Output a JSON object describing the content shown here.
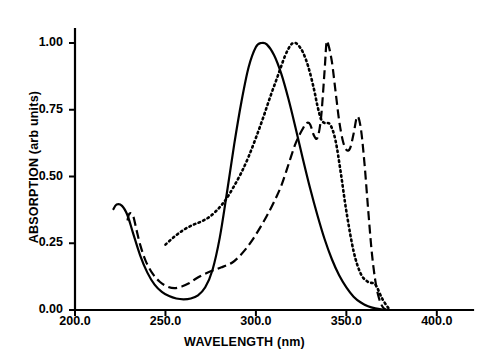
{
  "chart_data": {
    "type": "line",
    "title": "",
    "xlabel": "WAVELENGTH (nm)",
    "ylabel": "ABSORPTION (arb units)",
    "xlim": [
      200.0,
      420.0
    ],
    "ylim": [
      0.0,
      1.05
    ],
    "xticks": [
      "200.0",
      "250.0",
      "300.0",
      "350.0",
      "400.0"
    ],
    "xtick_values": [
      200.0,
      250.0,
      300.0,
      350.0,
      400.0
    ],
    "yticks": [
      "0.00",
      "0.25",
      "0.50",
      "0.75",
      "1.00"
    ],
    "ytick_values": [
      0.0,
      0.25,
      0.5,
      0.75,
      1.0
    ],
    "grid": false,
    "legend": "none",
    "axis_color": "#000000",
    "series": [
      {
        "name": "solid",
        "style": "solid",
        "color": "#000000",
        "peak_x": 303.0,
        "peak_y": 1.0,
        "x": [
          221,
          223,
          226,
          229,
          232,
          236,
          240,
          244,
          248,
          252,
          256,
          260,
          264,
          268,
          272,
          276,
          280,
          284,
          288,
          292,
          296,
          300,
          303,
          306,
          310,
          314,
          318,
          322,
          326,
          330,
          334,
          338,
          342,
          346,
          350,
          354,
          358,
          362,
          366,
          370,
          374
        ],
        "y": [
          0.375,
          0.395,
          0.39,
          0.355,
          0.29,
          0.205,
          0.14,
          0.095,
          0.068,
          0.052,
          0.043,
          0.04,
          0.043,
          0.055,
          0.085,
          0.15,
          0.27,
          0.44,
          0.62,
          0.78,
          0.91,
          0.985,
          1.0,
          0.995,
          0.955,
          0.885,
          0.79,
          0.68,
          0.565,
          0.455,
          0.355,
          0.265,
          0.19,
          0.13,
          0.085,
          0.05,
          0.028,
          0.014,
          0.006,
          0.002,
          0.0
        ]
      },
      {
        "name": "dotted",
        "style": "dotted",
        "color": "#000000",
        "peak_x": 321.0,
        "peak_y": 1.0,
        "x": [
          250,
          255,
          260,
          265,
          270,
          275,
          280,
          284,
          288,
          292,
          296,
          300,
          304,
          308,
          312,
          316,
          319,
          321,
          323,
          326,
          329,
          332,
          334,
          336,
          338,
          341,
          344,
          347,
          350,
          354,
          358,
          362,
          366,
          370,
          374
        ],
        "y": [
          0.245,
          0.275,
          0.3,
          0.318,
          0.332,
          0.352,
          0.385,
          0.42,
          0.465,
          0.515,
          0.575,
          0.645,
          0.72,
          0.8,
          0.875,
          0.95,
          0.99,
          1.0,
          0.995,
          0.965,
          0.91,
          0.83,
          0.765,
          0.715,
          0.7,
          0.695,
          0.635,
          0.51,
          0.37,
          0.22,
          0.135,
          0.105,
          0.095,
          0.04,
          0.0
        ]
      },
      {
        "name": "dashed",
        "style": "dashed",
        "color": "#000000",
        "peak_x": 339.0,
        "peak_y": 1.0,
        "secondary_peaks": [
          {
            "x": 330.0,
            "y": 0.7
          },
          {
            "x": 356.0,
            "y": 0.725
          }
        ],
        "x": [
          229,
          230,
          232,
          234,
          236,
          239,
          243,
          247,
          251,
          255,
          259,
          263,
          267,
          271,
          275,
          278,
          281,
          284,
          287,
          290,
          294,
          298,
          302,
          306,
          310,
          314,
          318,
          322,
          326,
          328,
          330,
          332,
          334,
          336,
          338,
          339,
          340,
          342,
          344,
          346,
          348,
          350,
          352,
          354,
          356,
          358,
          360,
          362,
          364,
          366,
          368,
          370,
          372
        ],
        "y": [
          0.335,
          0.36,
          0.355,
          0.3,
          0.245,
          0.185,
          0.135,
          0.105,
          0.088,
          0.082,
          0.088,
          0.1,
          0.118,
          0.133,
          0.145,
          0.152,
          0.16,
          0.168,
          0.178,
          0.195,
          0.225,
          0.262,
          0.305,
          0.352,
          0.405,
          0.465,
          0.545,
          0.625,
          0.68,
          0.7,
          0.695,
          0.655,
          0.645,
          0.72,
          0.9,
          1.0,
          0.995,
          0.93,
          0.82,
          0.71,
          0.635,
          0.6,
          0.605,
          0.66,
          0.725,
          0.68,
          0.55,
          0.38,
          0.22,
          0.11,
          0.045,
          0.012,
          0.0
        ]
      }
    ]
  },
  "axes": {
    "xlabel": "WAVELENGTH (nm)",
    "ylabel": "ABSORPTION (arb units)"
  }
}
